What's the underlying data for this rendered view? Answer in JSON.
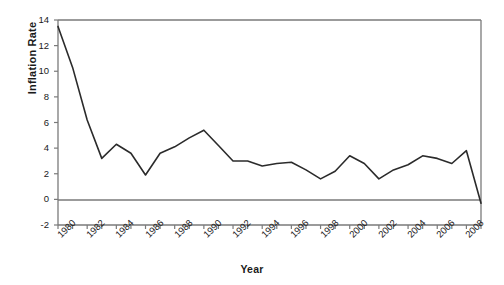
{
  "chart_data": {
    "type": "line",
    "title": "",
    "xlabel": "Year",
    "ylabel": "Inflation Rate",
    "xlim": [
      1980,
      2009
    ],
    "ylim": [
      -2,
      14
    ],
    "grid": false,
    "legend": "none",
    "zero_line": true,
    "y_ticks": [
      14,
      12,
      10,
      8,
      6,
      4,
      2,
      0,
      -2
    ],
    "x_ticks": [
      1980,
      1981,
      1982,
      1983,
      1984,
      1985,
      1986,
      1987,
      1988,
      1989,
      1990,
      1991,
      1992,
      1993,
      1994,
      1995,
      1996,
      1997,
      1998,
      1999,
      2000,
      2001,
      2002,
      2003,
      2004,
      2005,
      2006,
      2007,
      2008,
      2009
    ],
    "x_tick_labels": [
      "1980",
      "",
      "1982",
      "",
      "1984",
      "",
      "1986",
      "",
      "1988",
      "",
      "1990",
      "",
      "1992",
      "",
      "1994",
      "",
      "1996",
      "",
      "1998",
      "",
      "2000",
      "",
      "2002",
      "",
      "2004",
      "",
      "2006",
      "",
      "2008",
      ""
    ],
    "x": [
      1980,
      1981,
      1982,
      1983,
      1984,
      1985,
      1986,
      1987,
      1988,
      1989,
      1990,
      1991,
      1992,
      1993,
      1994,
      1995,
      1996,
      1997,
      1998,
      1999,
      2000,
      2001,
      2002,
      2003,
      2004,
      2005,
      2006,
      2007,
      2008,
      2009
    ],
    "values": [
      13.5,
      10.3,
      6.2,
      3.2,
      4.3,
      3.6,
      1.9,
      3.6,
      4.1,
      4.8,
      5.4,
      4.2,
      3.0,
      3.0,
      2.6,
      2.8,
      2.9,
      2.3,
      1.6,
      2.2,
      3.4,
      2.8,
      1.6,
      2.3,
      2.7,
      3.4,
      3.2,
      2.8,
      3.8,
      -0.3
    ],
    "series_name": "Inflation Rate",
    "line_color": "#2b2b2b",
    "axis_color": "#7a7a7a"
  }
}
